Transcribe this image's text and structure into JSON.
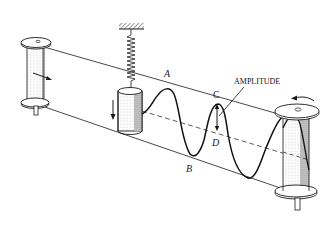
{
  "diagram": {
    "title": "",
    "labels": {
      "A": "A",
      "B": "B",
      "C": "C",
      "D": "D",
      "amplitude": "AMPLITUDE"
    },
    "components": [
      {
        "id": "left-spool",
        "description": "supply spool with arrow showing tape moving right"
      },
      {
        "id": "right-spool",
        "description": "take-up spool rotating counter-clockwise"
      },
      {
        "id": "spring",
        "description": "coil spring hanging from fixed ceiling mount"
      },
      {
        "id": "weight",
        "description": "cylindrical mass oscillating vertically with down arrow"
      },
      {
        "id": "wave",
        "description": "sinusoidal trace drawn on moving tape"
      },
      {
        "id": "centerline",
        "description": "dashed equilibrium line"
      }
    ],
    "colors": {
      "ink": "#1a1a1a",
      "paper": "#ffffff",
      "shade": "#9a9a9a"
    }
  }
}
